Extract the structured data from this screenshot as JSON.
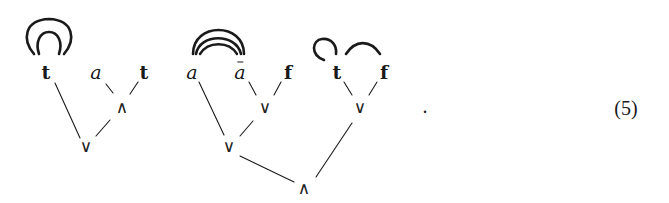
{
  "diagram": {
    "type": "proof-net / linkage trees",
    "trees": [
      {
        "leaves": [
          {
            "id": "t1",
            "label": "t",
            "style": "bold"
          },
          {
            "id": "a1",
            "label": "a",
            "style": "italic"
          },
          {
            "id": "t2",
            "label": "t",
            "style": "bold"
          }
        ],
        "nodes": [
          {
            "id": "and1",
            "label": "∧",
            "children": [
              "a1",
              "t2"
            ]
          },
          {
            "id": "or1",
            "label": "∨",
            "children": [
              "t1",
              "and1"
            ]
          }
        ],
        "links": [
          {
            "from": "t1",
            "to": "t1",
            "kind": "double self-loop"
          }
        ]
      },
      {
        "leaves": [
          {
            "id": "a2",
            "label": "a",
            "style": "italic"
          },
          {
            "id": "abar",
            "label": "a",
            "style": "italic-bar",
            "display": "ā"
          },
          {
            "id": "f1",
            "label": "f",
            "style": "bold"
          },
          {
            "id": "t3",
            "label": "t",
            "style": "bold"
          },
          {
            "id": "f2",
            "label": "f",
            "style": "bold"
          }
        ],
        "nodes": [
          {
            "id": "or2",
            "label": "∨",
            "children": [
              "abar",
              "f1"
            ]
          },
          {
            "id": "or3",
            "label": "∨",
            "children": [
              "a2",
              "or2"
            ]
          },
          {
            "id": "or4",
            "label": "∨",
            "children": [
              "t3",
              "f2"
            ]
          },
          {
            "id": "and2",
            "label": "∧",
            "children": [
              "or3",
              "or4"
            ]
          }
        ],
        "links": [
          {
            "from": "a2",
            "to": "abar",
            "kind": "triple arc"
          },
          {
            "from": "t3",
            "to": "t3",
            "kind": "self-loop"
          },
          {
            "from": "t3",
            "to": "f2",
            "kind": "arc"
          }
        ]
      }
    ],
    "terminator": ".",
    "equation_number": "(5)"
  }
}
